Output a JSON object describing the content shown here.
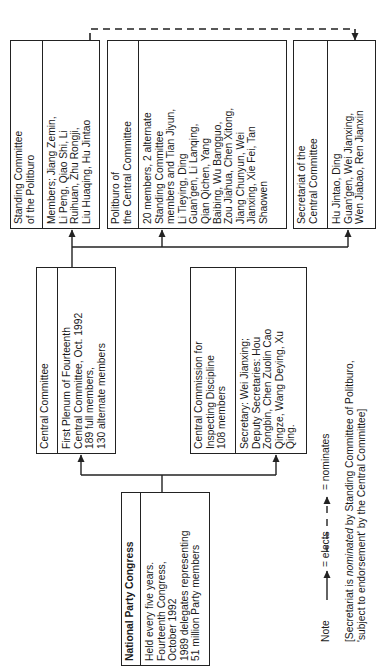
{
  "boxes": {
    "npc": {
      "title": "National Party Congress",
      "body": "Held every five years.\nFourteenth Congress,\nOctober 1992\n1989 delegates representing\n51 million Party members"
    },
    "central_committee": {
      "title": "Central Committee",
      "body": "First Plenum of Fourteenth\nCentral Committee, Oct. 1992\n189 full members,\n130 alternate members"
    },
    "ccid": {
      "title": "Central Commission for\nInspecting Discipline\n108 members",
      "body": "Secretary: Wei Jianxing;\nDeputy Secretaries: Hou\nZongbin, Chen Zuolin Cao\nQingze, Wang Deying, Xu\nQing."
    },
    "standing_committee": {
      "title": "Standing Committee\nof the Politburo",
      "body": "Members; Jiang Zemin,\nLi Peng, Qiao Shi, Li\nRuihuan, Zhu Rongji,\nLiu Huaqing, Hu Jintao"
    },
    "politburo": {
      "title": "Politburo of\nthe Central Committee",
      "body": "20 members, 2 alternate\nStanding Committee\nmembers and Tian Jiyun,\nLi Tieying, Ding\nGuan'gen, Li Lanqing,\nQian Qichen, Yang\nBaibing, Wu Bangguo,\nZou Jiahua, Chen Xitong,\nJiang Chunyun, Wei\nJianxing, Xie Fei, Tan\nShaowen"
    },
    "secretariat": {
      "title": "Secretariat of the\nCentral Committee",
      "body": "Hu Jintao, Ding\nGuan'gen, Wei Jianxing,\nWen Jiabao, Ren Jianxin"
    }
  },
  "legend": {
    "label": "Note",
    "elects": "= elects",
    "nominates": "= nominates"
  },
  "footnote": {
    "part1": "[Secretariat is ",
    "italic": "nominated",
    "part2": " by Standing Committee of Politburo,",
    "line2": "'subject to endorsement' by the Central Committee]"
  },
  "colors": {
    "line": "#222222",
    "background": "#ffffff"
  }
}
